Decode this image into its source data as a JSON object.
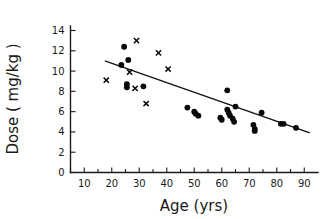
{
  "chart_data": {
    "type": "scatter",
    "title": "",
    "xlabel": "Age (yrs)",
    "ylabel": "Dose ( mg/kg )",
    "xlim": [
      5,
      95
    ],
    "ylim": [
      0,
      15
    ],
    "xticks": [
      10,
      20,
      30,
      40,
      50,
      60,
      70,
      80,
      90
    ],
    "xtick_labels": [
      "10",
      "20",
      "30",
      "40",
      "50",
      "60",
      "70",
      "80",
      "90"
    ],
    "xminor_step": 5,
    "yticks": [
      0,
      2,
      4,
      6,
      8,
      10,
      12,
      14
    ],
    "ytick_labels": [
      "0",
      "2",
      "4",
      "6",
      "8",
      "10",
      "12",
      "14"
    ],
    "grid": false,
    "legend": false,
    "legend_position": "none",
    "series": [
      {
        "name": "filled-circle",
        "marker": "circle",
        "color": "#080808",
        "points": [
          [
            24.5,
            12.4
          ],
          [
            26.0,
            11.1
          ],
          [
            23.5,
            10.6
          ],
          [
            25.5,
            8.7
          ],
          [
            25.5,
            8.4
          ],
          [
            31.5,
            8.5
          ],
          [
            47.5,
            6.4
          ],
          [
            50.0,
            6.0
          ],
          [
            50.5,
            5.8
          ],
          [
            51.5,
            5.6
          ],
          [
            62.0,
            8.1
          ],
          [
            59.5,
            5.4
          ],
          [
            60.0,
            5.2
          ],
          [
            62.0,
            6.2
          ],
          [
            62.5,
            5.9
          ],
          [
            63.0,
            5.6
          ],
          [
            64.0,
            5.3
          ],
          [
            64.5,
            5.0
          ],
          [
            65.0,
            6.5
          ],
          [
            71.5,
            4.7
          ],
          [
            72.0,
            4.3
          ],
          [
            72.0,
            4.1
          ],
          [
            74.5,
            5.9
          ],
          [
            81.5,
            4.8
          ],
          [
            82.5,
            4.8
          ],
          [
            87.0,
            4.4
          ]
        ]
      },
      {
        "name": "cross",
        "marker": "x",
        "color": "#080808",
        "points": [
          [
            18.0,
            9.1
          ],
          [
            26.5,
            9.9
          ],
          [
            28.5,
            8.3
          ],
          [
            29.0,
            13.0
          ],
          [
            32.5,
            6.8
          ],
          [
            37.0,
            11.8
          ],
          [
            40.5,
            10.2
          ]
        ]
      }
    ],
    "fit_line": {
      "name": "regression-line",
      "x_start": 17.5,
      "y_start": 11.0,
      "x_end": 92.0,
      "y_end": 3.9
    }
  }
}
